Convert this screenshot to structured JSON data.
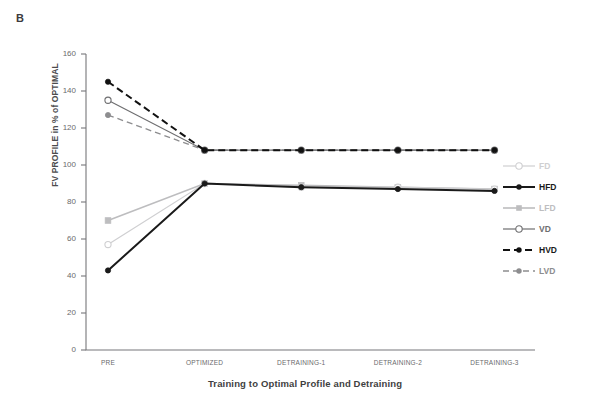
{
  "panel": {
    "label": "B"
  },
  "colors": {
    "fd": "#cfcfd1",
    "hfd": "#1a1a1a",
    "lfd": "#bdbdbf",
    "vd": "#6e6e70",
    "hvd": "#111111",
    "lvd": "#8d8d8f",
    "axis": "#77777a",
    "text": "#6a6a6c"
  },
  "legend": {
    "position": "right",
    "items": [
      {
        "label": "FD",
        "color": "#cfcfd1",
        "dash": "solid",
        "marker": "open-circle",
        "width": 1.2,
        "bold": false
      },
      {
        "label": "HFD",
        "color": "#1a1a1a",
        "dash": "solid",
        "marker": "filled-circle",
        "width": 2.0,
        "bold": true
      },
      {
        "label": "LFD",
        "color": "#bdbdbf",
        "dash": "solid",
        "marker": "filled-square",
        "width": 1.6,
        "bold": false
      },
      {
        "label": "VD",
        "color": "#6e6e70",
        "dash": "solid",
        "marker": "open-circle",
        "width": 1.2,
        "bold": false
      },
      {
        "label": "HVD",
        "color": "#111111",
        "dash": "dashed",
        "marker": "filled-circle",
        "width": 2.0,
        "bold": true
      },
      {
        "label": "LVD",
        "color": "#8d8d8f",
        "dash": "dashed",
        "marker": "filled-circle",
        "width": 1.3,
        "bold": false
      }
    ]
  },
  "chart_data": {
    "type": "line",
    "title": "",
    "xlabel": "Training to Optimal Profile and Detraining",
    "ylabel": "FV PROFILE in % of OPTIMAL",
    "categories": [
      "PRE",
      "OPTIMIZED",
      "DETRAINING-1",
      "DETRAINING-2",
      "DETRAINING-3"
    ],
    "ylim": [
      0,
      160
    ],
    "yticks": [
      0,
      20,
      40,
      60,
      80,
      100,
      120,
      140,
      160
    ],
    "grid": false,
    "legend_position": "right",
    "series": [
      {
        "name": "FD",
        "values": [
          57,
          90,
          88,
          88,
          87
        ]
      },
      {
        "name": "HFD",
        "values": [
          43,
          90,
          88,
          87,
          86
        ]
      },
      {
        "name": "LFD",
        "values": [
          70,
          90,
          89,
          88,
          87
        ]
      },
      {
        "name": "VD",
        "values": [
          135,
          108,
          108,
          108,
          108
        ]
      },
      {
        "name": "HVD",
        "values": [
          145,
          108,
          108,
          108,
          108
        ]
      },
      {
        "name": "LVD",
        "values": [
          127,
          108,
          108,
          108,
          108
        ]
      }
    ]
  }
}
